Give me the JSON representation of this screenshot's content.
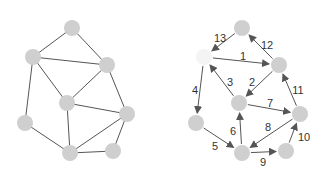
{
  "colors": {
    "node": "#cfcfcf",
    "node_highlight": "#f4f4f4",
    "edge": "#555555",
    "label": "#333333"
  },
  "graphs": [
    {
      "name": "undirected-graph",
      "directed": false,
      "nodes": [
        {
          "id": "A",
          "x": 72,
          "y": 28
        },
        {
          "id": "B",
          "x": 33,
          "y": 57
        },
        {
          "id": "C",
          "x": 107,
          "y": 65
        },
        {
          "id": "D",
          "x": 67,
          "y": 103
        },
        {
          "id": "E",
          "x": 127,
          "y": 114
        },
        {
          "id": "F",
          "x": 25,
          "y": 123
        },
        {
          "id": "G",
          "x": 70,
          "y": 153
        },
        {
          "id": "H",
          "x": 113,
          "y": 151
        }
      ],
      "edges": [
        {
          "from": "A",
          "to": "B"
        },
        {
          "from": "A",
          "to": "C"
        },
        {
          "from": "B",
          "to": "C"
        },
        {
          "from": "B",
          "to": "D"
        },
        {
          "from": "B",
          "to": "F"
        },
        {
          "from": "C",
          "to": "D"
        },
        {
          "from": "C",
          "to": "E"
        },
        {
          "from": "D",
          "to": "E"
        },
        {
          "from": "D",
          "to": "G"
        },
        {
          "from": "F",
          "to": "G"
        },
        {
          "from": "E",
          "to": "G"
        },
        {
          "from": "G",
          "to": "H"
        },
        {
          "from": "E",
          "to": "H"
        }
      ]
    },
    {
      "name": "directed-numbered-graph",
      "directed": true,
      "nodes": [
        {
          "id": "A",
          "x": 242,
          "y": 28
        },
        {
          "id": "B",
          "x": 204,
          "y": 57,
          "highlight": true
        },
        {
          "id": "C",
          "x": 279,
          "y": 65
        },
        {
          "id": "D",
          "x": 239,
          "y": 103
        },
        {
          "id": "E",
          "x": 300,
          "y": 114
        },
        {
          "id": "F",
          "x": 196,
          "y": 123
        },
        {
          "id": "G",
          "x": 242,
          "y": 153
        },
        {
          "id": "H",
          "x": 286,
          "y": 151
        }
      ],
      "edges": [
        {
          "from": "B",
          "to": "C",
          "label": "1",
          "lx": 243,
          "ly": 60
        },
        {
          "from": "C",
          "to": "D",
          "label": "2",
          "lx": 252,
          "ly": 86
        },
        {
          "from": "D",
          "to": "B",
          "label": "3",
          "lx": 230,
          "ly": 86
        },
        {
          "from": "B",
          "to": "F",
          "label": "4",
          "lx": 195,
          "ly": 94
        },
        {
          "from": "F",
          "to": "G",
          "label": "5",
          "lx": 215,
          "ly": 150
        },
        {
          "from": "G",
          "to": "D",
          "label": "6",
          "lx": 233,
          "ly": 135
        },
        {
          "from": "D",
          "to": "E",
          "label": "7",
          "lx": 270,
          "ly": 107
        },
        {
          "from": "E",
          "to": "G",
          "label": "8",
          "lx": 268,
          "ly": 131
        },
        {
          "from": "G",
          "to": "H",
          "label": "9",
          "lx": 263,
          "ly": 166
        },
        {
          "from": "H",
          "to": "E",
          "label": "10",
          "lx": 304,
          "ly": 141
        },
        {
          "from": "E",
          "to": "C",
          "label": "11",
          "lx": 298,
          "ly": 94
        },
        {
          "from": "C",
          "to": "A",
          "label": "12",
          "lx": 267,
          "ly": 49
        },
        {
          "from": "A",
          "to": "B",
          "label": "13",
          "lx": 220,
          "ly": 42
        }
      ]
    }
  ]
}
